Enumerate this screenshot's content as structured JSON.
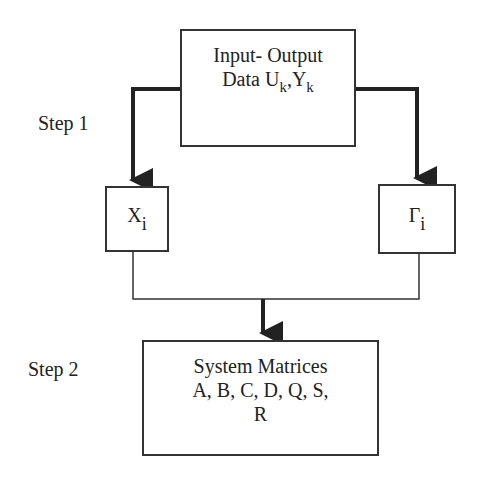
{
  "diagram": {
    "steps": [
      {
        "label": "Step 1"
      },
      {
        "label": "Step 2"
      }
    ],
    "nodes": {
      "input_output": {
        "line1": "Input- Output",
        "line2_prefix": "Data U",
        "u_sub": "k",
        "separator": ",Y",
        "y_sub": "k"
      },
      "state_sequence": {
        "symbol": "X",
        "sub": "i"
      },
      "observability_matrix": {
        "symbol": "Γ",
        "sub": "i"
      },
      "system_matrices": {
        "line1": "System Matrices",
        "line2": "A, B, C, D, Q, S,",
        "line3": "R"
      }
    },
    "edges": [
      {
        "from": "input_output",
        "to": "state_sequence",
        "style": "thick-arrow"
      },
      {
        "from": "input_output",
        "to": "observability_matrix",
        "style": "thick-arrow"
      },
      {
        "from": "state_sequence",
        "to": "system_matrices",
        "style": "thin-line-merge"
      },
      {
        "from": "observability_matrix",
        "to": "system_matrices",
        "style": "thin-line-merge"
      }
    ],
    "colors": {
      "line": "#333333",
      "background": "#ffffff",
      "text": "#222222"
    }
  }
}
